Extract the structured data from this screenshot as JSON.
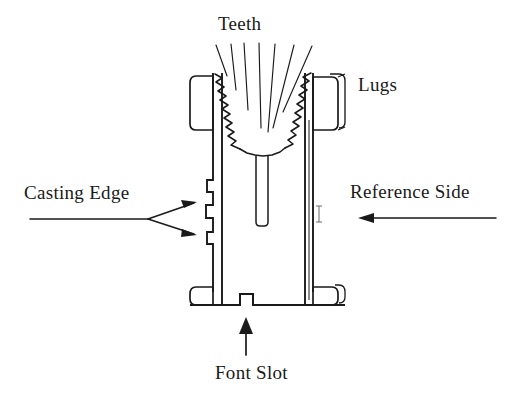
{
  "figure": {
    "background_color": "#ffffff",
    "stroke_color": "#1a1a1a",
    "width": 518,
    "height": 395
  },
  "labels": {
    "teeth": "Teeth",
    "lugs": "Lugs",
    "casting_edge": "Casting Edge",
    "reference_side": "Reference Side",
    "font_slot": "Font Slot"
  },
  "callouts": [
    {
      "name": "teeth",
      "text": "Teeth",
      "pointer": "radiating-leader-lines",
      "target": "serrated-v-notch"
    },
    {
      "name": "lugs",
      "text": "Lugs",
      "pointer": "none",
      "target": "upper-right-lug"
    },
    {
      "name": "casting-edge",
      "text": "Casting Edge",
      "pointer": "forked-double-arrow",
      "target": "left-stepped-edge"
    },
    {
      "name": "reference-side",
      "text": "Reference Side",
      "pointer": "left-arrow",
      "target": "right-side-face"
    },
    {
      "name": "font-slot",
      "text": "Font Slot",
      "pointer": "up-arrow",
      "target": "bottom-center-notch"
    }
  ],
  "parts": [
    {
      "name": "body",
      "description": "main rectangular type body"
    },
    {
      "name": "upper-left-lug",
      "description": "rounded rectangular lug at upper left"
    },
    {
      "name": "upper-right-lug",
      "description": "rounded rectangular lug at upper right, drawn with depth"
    },
    {
      "name": "lower-left-lug",
      "description": "rounded lug at lower left"
    },
    {
      "name": "lower-right-lug",
      "description": "rounded lug at lower right, drawn with depth"
    },
    {
      "name": "serrated-v-notch",
      "description": "zigzag toothed V-shaped groove at top center"
    },
    {
      "name": "stem",
      "description": "narrow vertical channel descending from V apex"
    },
    {
      "name": "casting-stepped-edge",
      "description": "stepped notches along left body edge"
    },
    {
      "name": "font-slot-notch",
      "description": "small rectangular notch at bottom center"
    }
  ]
}
